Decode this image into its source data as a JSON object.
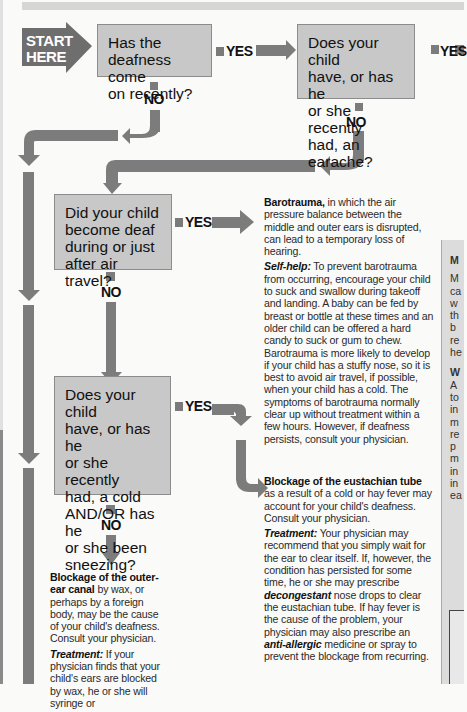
{
  "start": {
    "line1": "START",
    "line2": "HERE"
  },
  "labels": {
    "yes": "YES",
    "no": "NO"
  },
  "questions": [
    {
      "id": "q1",
      "text_lines": [
        "Has the",
        "deafness come",
        "on recently?"
      ]
    },
    {
      "id": "q2",
      "text_lines": [
        "Does your child",
        "have, or has he",
        "or she recently",
        "had, an earache?"
      ]
    },
    {
      "id": "q3",
      "text_lines": [
        "Did your child",
        "become deaf",
        "during or just",
        "after air travel?"
      ]
    },
    {
      "id": "q4",
      "text_lines": [
        "Does your child",
        "have, or has he",
        "or she recently",
        "had, a cold",
        "AND/OR has he",
        "or she been",
        "sneezing?"
      ]
    }
  ],
  "barotrauma": {
    "title": "Barotrauma,",
    "intro": " in which the air pressure balance between the middle and outer ears is disrupted, can lead to a temporary loss of hearing.",
    "selfhelp_label": "Self-help:",
    "selfhelp_text": " To prevent barotrauma from occurring, encourage your child to suck and swallow during takeoff and landing. A baby can be fed by breast or bottle at these times and an older child can be offered a hard candy to suck or gum to chew. Barotrauma is more likely to develop if your child has a stuffy nose, so it is best to avoid air travel, if possible, when your child has a cold. The symptoms of barotrauma normally clear up without treatment within a few hours. However, if deafness persists, consult your physician."
  },
  "eustachian": {
    "title": "Blockage of the eustachian tube",
    "intro": " as a result of a cold or hay fever may account for your child's deafness. Consult your physician.",
    "treatment_label": "Treatment:",
    "treatment_text_1": " Your physician may recommend that you simply wait for the ear to clear itself. If, however, the condition has persisted for some time, he or she may prescribe ",
    "treatment_em_1": "decongestant",
    "treatment_text_2": " nose drops to clear the eustachian tube. If hay fever is the cause of the problem, your physician may also prescribe an ",
    "treatment_em_2": "anti-allergic",
    "treatment_text_3": " medicine or spray to prevent the blockage from recurring."
  },
  "outer_ear": {
    "title": "Blockage of the outer-ear canal",
    "intro": " by wax, or perhaps by a foreign body, may be the cause of your child's deafness. Consult your physician.",
    "treatment_label": "Treatment:",
    "treatment_text": " If your physician finds that your child's ears are blocked by wax, he or she will syringe or"
  },
  "side_panel": {
    "heading1": "M",
    "lines1": [
      "M",
      "ca",
      "w",
      "th",
      "b",
      "re",
      "he"
    ],
    "heading2": "W",
    "lines2": [
      "A",
      "to",
      "in",
      "m",
      "re",
      "p",
      "m",
      "in",
      "in",
      "ea"
    ]
  },
  "colors": {
    "arrow": "#7c7c7c",
    "start": "#6e6e6e",
    "question_box": "#c8c8c8",
    "side_panel": "#dcdcdc"
  }
}
